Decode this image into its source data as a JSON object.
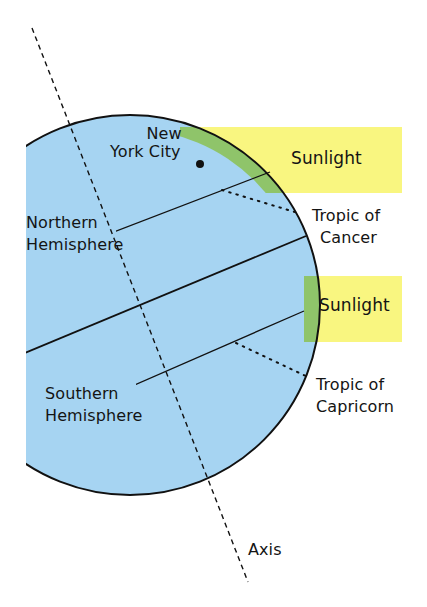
{
  "diagram": {
    "colors": {
      "ocean": "#a6d4f2",
      "sunlight": "#f9f680",
      "overlap": "#8fc46a",
      "line": "#111111"
    },
    "labels": {
      "city_line1": "New",
      "city_line2": "York City",
      "sunlight_top": "Sunlight",
      "sunlight_middle": "Sunlight",
      "northern_line1": "Northern",
      "northern_line2": "Hemisphere",
      "southern_line1": "Southern",
      "southern_line2": "Hemisphere",
      "cancer_line1": "Tropic of",
      "cancer_line2": "Cancer",
      "capricorn_line1": "Tropic of",
      "capricorn_line2": "Capricorn",
      "axis": "Axis"
    }
  }
}
